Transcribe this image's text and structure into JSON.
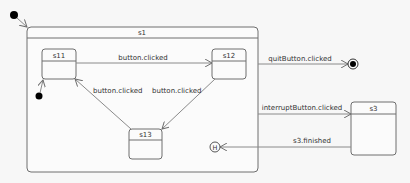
{
  "diagram": {
    "type": "state-machine",
    "states": {
      "s1": {
        "name": "s1",
        "kind": "composite"
      },
      "s11": {
        "name": "s11"
      },
      "s12": {
        "name": "s12"
      },
      "s13": {
        "name": "s13"
      },
      "s3": {
        "name": "s3"
      }
    },
    "pseudostates": {
      "history": {
        "label": "H"
      }
    },
    "transitions": [
      {
        "id": "t1",
        "from": "s11",
        "to": "s12",
        "label": "button.clicked"
      },
      {
        "id": "t2",
        "from": "s12",
        "to": "s13",
        "label": "button.clicked"
      },
      {
        "id": "t3",
        "from": "s13",
        "to": "s11",
        "label": "button.clicked"
      },
      {
        "id": "t4",
        "from": "s1",
        "to": "final",
        "label": "quitButton.clicked"
      },
      {
        "id": "t5",
        "from": "s1",
        "to": "s3",
        "label": "interruptButton.clicked"
      },
      {
        "id": "t6",
        "from": "s3",
        "to": "history",
        "label": "s3.finished"
      }
    ],
    "colors": {
      "stroke": "#6e6e6e",
      "edge": "#8a8a8a",
      "fill": "#fbfbfb",
      "background": "#f7f7f7",
      "dot": "#000000"
    }
  }
}
